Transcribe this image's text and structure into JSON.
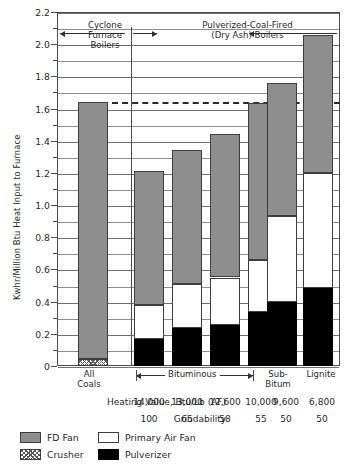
{
  "chart_data": {
    "type": "bar",
    "title": "",
    "subtitle": "",
    "xlabel": "",
    "ylabel": "Kwhr/Million Btu Heat Input to Furnace",
    "ylim": [
      0,
      2.2
    ],
    "ytick_labels": [
      "0",
      "0.2",
      "0.4",
      "0.6",
      "0.8",
      "1.0",
      "1.2",
      "1.4",
      "1.6",
      "1.8",
      "2.0",
      "2.2"
    ],
    "ytick_values": [
      0,
      0.2,
      0.4,
      0.6,
      0.8,
      1.0,
      1.2,
      1.4,
      1.6,
      1.8,
      2.0,
      2.2
    ],
    "minor_gridlines": true,
    "grid": true,
    "legend_position": "below-axes",
    "categories": [
      "All Coals",
      "14,000",
      "13,000",
      "12,600",
      "10,000",
      "9,600",
      "6,800"
    ],
    "category_labels": [
      "All\nCoals",
      "",
      "",
      "",
      "",
      "Sub-\nBitum",
      "Lignite"
    ],
    "series": [
      {
        "name": "Pulverizer",
        "color": "#000000",
        "values": [
          0.0,
          0.165,
          0.235,
          0.255,
          0.335,
          0.395,
          0.485
        ]
      },
      {
        "name": "Crusher",
        "color": "#ffffff",
        "values": [
          0.045,
          0.0,
          0.0,
          0.0,
          0.0,
          0.0,
          0.0
        ]
      },
      {
        "name": "Primary Air Fan",
        "color": "#ffffff",
        "values": [
          0.0,
          0.215,
          0.275,
          0.295,
          0.325,
          0.535,
          0.715
        ]
      },
      {
        "name": "FD Fan",
        "color": "#8e8e8e",
        "values": [
          1.595,
          0.83,
          0.83,
          0.89,
          0.975,
          0.83,
          0.855
        ]
      }
    ],
    "totals": [
      1.64,
      1.21,
      1.34,
      1.44,
      1.635,
      1.76,
      2.055
    ],
    "reference_line": {
      "value": 1.64,
      "style": "dashed",
      "label": ""
    },
    "annotations": [
      {
        "text": "Cyclone Furnace Boilers",
        "lines": [
          "Cyclone",
          "Furnace",
          "Boilers"
        ]
      },
      {
        "text": "Pulverized-Coal-Fired (Dry Ash) Boilers",
        "lines": [
          "Pulverized-Coal-Fired",
          "(Dry Ash) Boilers"
        ]
      },
      {
        "text": "Bituminous"
      }
    ],
    "table_rows": [
      {
        "label": "Heating Value, Btu/Lb (AF)",
        "values": [
          "14,000",
          "13,000",
          "12,600",
          "10,000",
          "9,600",
          "6,800"
        ]
      },
      {
        "label": "Grindability",
        "values": [
          "100",
          "65",
          "58",
          "55",
          "50",
          "50"
        ]
      }
    ]
  },
  "axis": {
    "y_title": "Kwhr/Million Btu Heat Input to Furnace",
    "ticks": [
      "2.2",
      "2.0",
      "1.8",
      "1.6",
      "1.4",
      "1.2",
      "1.0",
      "0.8",
      "0.6",
      "0.4",
      "0.2",
      "0"
    ]
  },
  "annotations": {
    "cyclone_line1": "Cyclone",
    "cyclone_line2": "Furnace",
    "cyclone_line3": "Boilers",
    "pulverized_line1": "Pulverized-Coal-Fired",
    "pulverized_line2": "(Dry Ash) Boilers",
    "bituminous": "Bituminous"
  },
  "categories": {
    "all_coals_line1": "All",
    "all_coals_line2": "Coals",
    "sub_bitum_line1": "Sub-",
    "sub_bitum_line2": "Bitum",
    "lignite": "Lignite"
  },
  "table": {
    "heating_label": "Heating Value, Btu/Lb (AF)",
    "heating_values": [
      "14,000",
      "13,000",
      "12,600",
      "10,000",
      "9,600",
      "6,800"
    ],
    "grindability_label": "Grindability",
    "grindability_values": [
      "100",
      "65",
      "58",
      "55",
      "50",
      "50"
    ]
  },
  "legend": {
    "fd_fan": "FD Fan",
    "primary_air_fan": "Primary Air Fan",
    "crusher": "Crusher",
    "pulverizer": "Pulverizer"
  },
  "colors": {
    "fd_fan": "#8e8e8e",
    "primary_air_fan": "#ffffff",
    "pulverizer": "#000000",
    "grid": "#8d8d8d",
    "axis": "#4a4a4a"
  }
}
